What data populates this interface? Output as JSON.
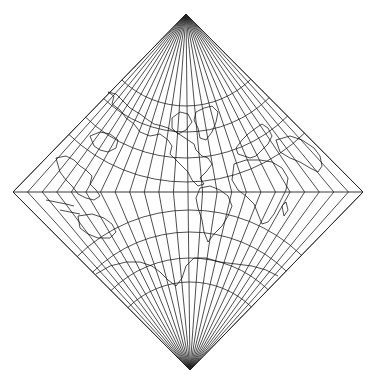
{
  "map": {
    "title": "",
    "projection": "Diamond-shaped conic world projection",
    "colors": {
      "background": "#ffffff",
      "lines": "#222222",
      "coast": "#111111"
    },
    "frame": {
      "top_apex": [
        186,
        14
      ],
      "left_corner": [
        13,
        192
      ],
      "right_corner": [
        363,
        192
      ],
      "bottom_apex": [
        190,
        370
      ]
    },
    "graticule": {
      "meridian_count": 25,
      "northern_parallel_radii": [
        92,
        118,
        144,
        168
      ],
      "southern_parallel_radii": [
        88,
        112,
        138,
        160
      ],
      "equator_y": 192
    },
    "features": [
      "North America",
      "South America",
      "Europe",
      "Africa",
      "Asia",
      "Australia",
      "Antarctica",
      "Greenland"
    ]
  }
}
